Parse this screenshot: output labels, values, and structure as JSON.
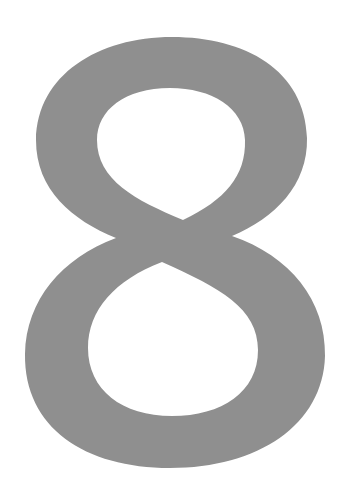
{
  "image": {
    "glyph": "8",
    "description": "Large gray numeral eight on white background",
    "colors": {
      "background": "#ffffff",
      "glyph": "#8f8f8f"
    }
  }
}
